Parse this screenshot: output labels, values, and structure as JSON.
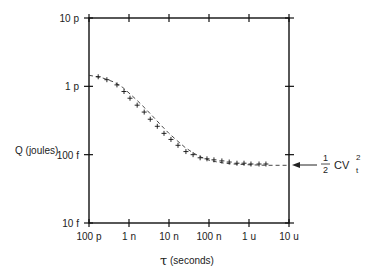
{
  "chart_data": {
    "type": "line",
    "title": "",
    "xlabel_symbol": "τ",
    "xlabel": "(seconds)",
    "ylabel": "Q (joules)",
    "xscale": "log",
    "yscale": "log",
    "xlim": [
      1e-10,
      1e-05
    ],
    "ylim": [
      1e-14,
      1e-11
    ],
    "x_ticks": [
      {
        "value": 1e-10,
        "label": "100 p"
      },
      {
        "value": 1e-09,
        "label": "1 n"
      },
      {
        "value": 1e-08,
        "label": "10 n"
      },
      {
        "value": 1e-07,
        "label": "100 n"
      },
      {
        "value": 1e-06,
        "label": "1 u"
      },
      {
        "value": 1e-05,
        "label": "10 u"
      }
    ],
    "y_ticks": [
      {
        "value": 1e-11,
        "label": "10 p"
      },
      {
        "value": 1e-12,
        "label": "1 p"
      },
      {
        "value": 1e-13,
        "label": "100 f"
      },
      {
        "value": 1e-14,
        "label": "10 f"
      }
    ],
    "grid": false,
    "series": [
      {
        "name": "measured",
        "style": "plus-markers",
        "x": [
          1.7e-10,
          2.8e-10,
          5e-10,
          7.5e-10,
          1.06e-09,
          1.6e-09,
          2.4e-09,
          3.4e-09,
          5.1e-09,
          7.5e-09,
          1.12e-08,
          1.68e-08,
          2.65e-08,
          4e-08,
          6e-08,
          8.9e-08,
          1.33e-07,
          2.1e-07,
          3.2e-07,
          5e-07,
          7.5e-07,
          1.12e-06,
          1.78e-06,
          2.65e-06
        ],
        "y": [
          1.38e-12,
          1.25e-12,
          1.05e-12,
          8.4e-13,
          6.7e-13,
          5.3e-13,
          4.2e-13,
          3.3e-13,
          2.6e-13,
          2.05e-13,
          1.67e-13,
          1.37e-13,
          1.11e-13,
          1e-13,
          9e-14,
          8.7e-14,
          8.4e-14,
          8.1e-14,
          7.8e-14,
          7.5e-14,
          7.5e-14,
          7.3e-14,
          7.3e-14,
          7.3e-14
        ]
      },
      {
        "name": "model",
        "style": "dashed",
        "x": [
          1e-10,
          2e-10,
          4e-10,
          7e-10,
          1e-09,
          1.6e-09,
          2.5e-09,
          4e-09,
          6.3e-09,
          1e-08,
          1.6e-08,
          2.5e-08,
          4e-08,
          6.3e-08,
          1e-07,
          1.6e-07,
          2.5e-07,
          4e-07,
          6.3e-07,
          1e-06,
          1.6e-06,
          2.5e-06,
          4e-06,
          1e-05
        ],
        "y": [
          1.45e-12,
          1.35e-12,
          1.17e-12,
          9.6e-13,
          8e-13,
          6.2e-13,
          4.8e-13,
          3.6e-13,
          2.7e-13,
          2.05e-13,
          1.6e-13,
          1.28e-13,
          1.06e-13,
          9.2e-14,
          8.3e-14,
          7.8e-14,
          7.5e-14,
          7.3e-14,
          7.2e-14,
          7.1e-14,
          7.05e-14,
          7e-14,
          7e-14,
          7e-14
        ]
      }
    ],
    "annotations": [
      {
        "text": "½ CV_t²",
        "fraction_num": "1",
        "fraction_den": "2",
        "body": "CV",
        "sup": "2",
        "sub": "t",
        "points_to_y": 7e-14,
        "arrow": "left"
      }
    ]
  }
}
